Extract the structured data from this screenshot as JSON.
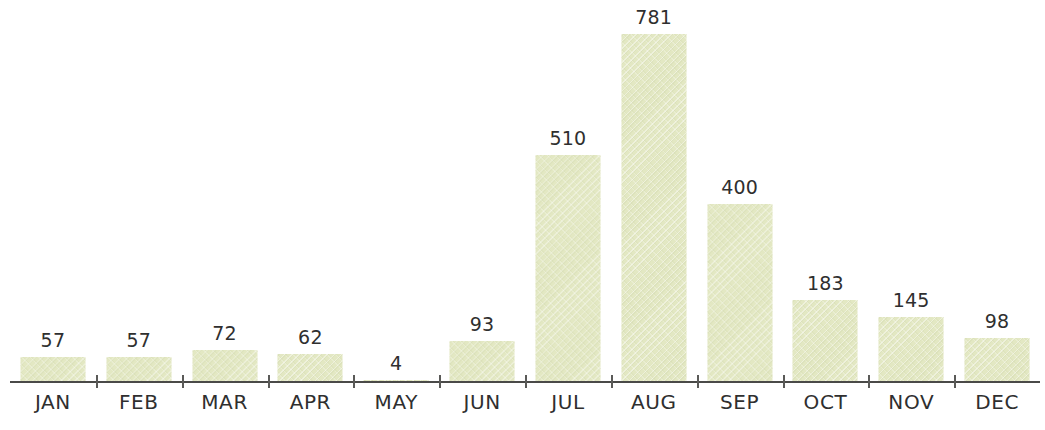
{
  "chart_data": {
    "type": "bar",
    "title": "",
    "subtitle": "",
    "xlabel": "",
    "ylabel": "",
    "categories": [
      "JAN",
      "FEB",
      "MAR",
      "APR",
      "MAY",
      "JUN",
      "JUL",
      "AUG",
      "SEP",
      "OCT",
      "NOV",
      "DEC"
    ],
    "values": [
      57,
      57,
      72,
      62,
      4,
      93,
      510,
      781,
      400,
      183,
      145,
      98
    ],
    "value_labels": [
      "57",
      "57",
      "72",
      "62",
      "4",
      "93",
      "510",
      "781",
      "400",
      "183",
      "145",
      "98"
    ],
    "ylim": [
      0,
      781
    ],
    "grid": false,
    "legend": null,
    "y_axis_visible": false,
    "x_axis_visible": true,
    "data_labels_shown": true,
    "annotations": []
  },
  "style": {
    "background_color": "#ffffff",
    "bar_color": "#e3e8c3",
    "axis_color": "#4a4a48",
    "tick_color": "#5a5a58",
    "text_color": "#2f2f2f"
  }
}
